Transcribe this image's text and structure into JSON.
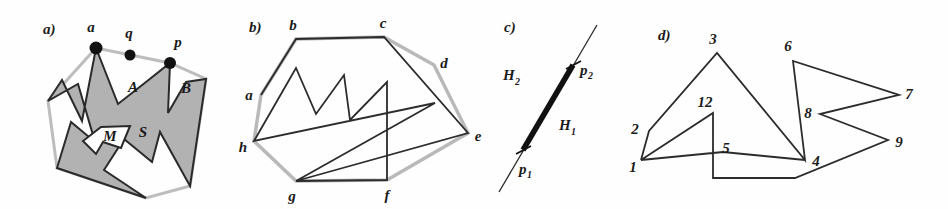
{
  "figure": {
    "background": "#fefefe",
    "ink": "#1a1a1a",
    "fill_gray": "#b0b0b0",
    "hull_gray": "#b9b9b9"
  },
  "panels": [
    {
      "id": "a",
      "label": "a)",
      "caption_labels": [
        "a",
        "q",
        "p",
        "A",
        "B",
        "S",
        "M"
      ],
      "description": "Star-shaped polygon S with kernel M, points a, q, p on boundary, pockets A and B",
      "points": [
        {
          "name": "a",
          "label": "a",
          "x": 96,
          "y": 48,
          "dot": true
        },
        {
          "name": "q",
          "label": "q",
          "x": 130,
          "y": 55,
          "dot": true
        },
        {
          "name": "p",
          "label": "p",
          "x": 170,
          "y": 63,
          "dot": true
        }
      ],
      "region_labels": [
        {
          "label": "A",
          "x": 133,
          "y": 89
        },
        {
          "label": "B",
          "x": 182,
          "y": 89
        },
        {
          "label": "S",
          "x": 140,
          "y": 131
        },
        {
          "label": "M",
          "x": 101,
          "y": 136
        }
      ],
      "hull_polygon": "96,48 170,63 206,79 190,186 146,198 57,168 48,101",
      "star_polygon": "96,48 118,104 146,82 170,63 168,113 186,82 206,79 190,186 160,132 152,162 124,139 104,170 146,198 57,168 71,122 95,142 78,84 48,101 62,80 82,121",
      "kernel_polygon": "101,129 128,127 121,146 104,143 95,152 83,141"
    },
    {
      "id": "b",
      "label": "b)",
      "caption_labels": [
        "a",
        "b",
        "c",
        "d",
        "e",
        "f",
        "g",
        "h"
      ],
      "description": "Convex hull (light gray) of a simple polygon with labelled vertices a-h and interior polygon chain",
      "points": [
        {
          "name": "b",
          "label": "b",
          "x": 296,
          "y": 39,
          "lx": 293,
          "ly": 35
        },
        {
          "name": "c",
          "label": "c",
          "x": 384,
          "y": 37,
          "lx": 382,
          "ly": 33
        },
        {
          "name": "d",
          "label": "d",
          "x": 434,
          "y": 65,
          "lx": 440,
          "ly": 66
        },
        {
          "name": "e",
          "label": "e",
          "x": 468,
          "y": 133,
          "lx": 474,
          "ly": 137
        },
        {
          "name": "f",
          "label": "f",
          "x": 387,
          "y": 180,
          "lx": 385,
          "ly": 196
        },
        {
          "name": "g",
          "label": "g",
          "x": 296,
          "y": 181,
          "lx": 291,
          "ly": 196
        },
        {
          "name": "h",
          "label": "h",
          "x": 254,
          "y": 141,
          "lx": 243,
          "ly": 148
        },
        {
          "name": "a",
          "label": "a",
          "x": 261,
          "y": 95,
          "lx": 250,
          "ly": 97
        }
      ],
      "hull_polygon": "296,39 384,37 434,65 468,133 387,180 296,181 254,141 261,95",
      "inner_chain": "261,95 296,39 384,37 468,133 296,181 387,180 387,82 350,120 344,75 316,114 296,68 254,141 435,103 296,181"
    },
    {
      "id": "c",
      "label": "c)",
      "description": "A line through two points p1 and p2 dividing the plane into half-planes H1 and H2",
      "points": [
        {
          "name": "p1",
          "label": "p",
          "sub": "1",
          "x": 523,
          "y": 150,
          "lx": 521,
          "ly": 172
        },
        {
          "name": "p2",
          "label": "p",
          "sub": "2",
          "x": 573,
          "y": 65,
          "lx": 579,
          "ly": 71
        }
      ],
      "halfplane_labels": [
        {
          "label": "H",
          "sub": "2",
          "x": 509,
          "y": 78
        },
        {
          "label": "H",
          "sub": "1",
          "x": 565,
          "y": 127
        }
      ],
      "line": {
        "x1": 499,
        "y1": 192,
        "x2": 597,
        "y2": 25
      },
      "segment": {
        "x1": 523,
        "y1": 150,
        "x2": 573,
        "y2": 65
      }
    },
    {
      "id": "d",
      "label": "d)",
      "description": "A self-intersecting polygonal chain with numbered vertices",
      "points": [
        {
          "name": "1",
          "label": "1",
          "x": 641,
          "y": 160,
          "lx": 632,
          "ly": 168
        },
        {
          "name": "2",
          "label": "2",
          "x": 649,
          "y": 131,
          "lx": 634,
          "ly": 131
        },
        {
          "name": "3",
          "label": "3",
          "x": 717,
          "y": 53,
          "lx": 712,
          "ly": 44
        },
        {
          "name": "12",
          "label": "12",
          "x": 713,
          "y": 113,
          "lx": 706,
          "ly": 105
        },
        {
          "name": "5",
          "label": "5",
          "x": 723,
          "y": 152,
          "lx": 722,
          "ly": 151
        },
        {
          "name": "4",
          "label": "4",
          "x": 805,
          "y": 160,
          "lx": 811,
          "ly": 164
        },
        {
          "name": "6",
          "label": "6",
          "x": 793,
          "y": 61,
          "lx": 787,
          "ly": 52
        },
        {
          "name": "7",
          "label": "7",
          "x": 899,
          "y": 95,
          "lx": 905,
          "ly": 97
        },
        {
          "name": "8",
          "label": "8",
          "x": 820,
          "y": 114,
          "lx": 806,
          "ly": 116
        },
        {
          "name": "9",
          "label": "9",
          "x": 888,
          "y": 140,
          "lx": 896,
          "ly": 145
        }
      ],
      "chain": "641,160 649,131 717,53 805,160 793,61 899,95 820,114 888,140 795,178 713,178 713,113 641,160 723,152 805,160"
    }
  ]
}
